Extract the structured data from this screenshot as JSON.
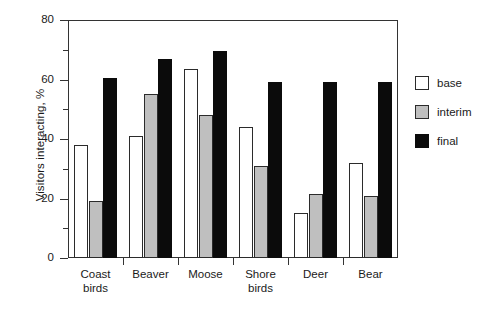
{
  "chart_data": {
    "type": "bar",
    "title": "",
    "xlabel": "",
    "ylabel": "Visitors interacting, %",
    "ylim": [
      0,
      80
    ],
    "yticks": [
      0,
      20,
      40,
      60,
      80
    ],
    "yminorticks": [
      10,
      30,
      50,
      70
    ],
    "grid": false,
    "legend_position": "right",
    "categories": [
      "Coast birds",
      "Beaver",
      "Moose",
      "Shore birds",
      "Deer",
      "Bear"
    ],
    "category_lines": [
      [
        "Coast",
        "birds"
      ],
      [
        "Beaver",
        ""
      ],
      [
        "Moose",
        ""
      ],
      [
        "Shore",
        "birds"
      ],
      [
        "Deer",
        ""
      ],
      [
        "Bear",
        ""
      ]
    ],
    "series": [
      {
        "name": "base",
        "color": "#ffffff",
        "values": [
          38,
          41,
          63.5,
          44,
          15,
          32
        ]
      },
      {
        "name": "interim",
        "color": "#bfbfbf",
        "values": [
          19,
          55,
          48,
          31,
          21.5,
          21
        ]
      },
      {
        "name": "final",
        "color": "#0b0b0b",
        "values": [
          60.5,
          67,
          69.5,
          59,
          59,
          59
        ]
      }
    ]
  },
  "axis": {
    "ylabel": "Visitors interacting, %",
    "ytick_labels": [
      "0",
      "20",
      "40",
      "60",
      "80"
    ]
  },
  "legend": {
    "items": [
      {
        "label": "base",
        "swatch": "base"
      },
      {
        "label": "interim",
        "swatch": "interim"
      },
      {
        "label": "final",
        "swatch": "final"
      }
    ]
  },
  "caption": {
    "sliver": ""
  }
}
